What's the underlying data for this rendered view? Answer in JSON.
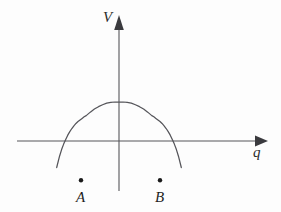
{
  "figure": {
    "kind": "line",
    "background_color": "#fdfdfd",
    "curve_color": "#55555a",
    "axis_color": "#56565a",
    "label_color": "#1f1f1f"
  },
  "axes": {
    "vertical": {
      "label": "V",
      "arrow": "arrow-up",
      "x_px": 119,
      "top_px": 16,
      "bottom_px": 191
    },
    "horizontal": {
      "label": "q",
      "arrow": "arrow-right",
      "y_px": 141,
      "left_px": 17,
      "right_px": 266
    },
    "origin_px": [
      119,
      141
    ]
  },
  "markers": [
    {
      "label": "A",
      "x_px": 81,
      "y_px": 180,
      "role": "left-minimum"
    },
    {
      "label": "B",
      "x_px": 160,
      "y_px": 180,
      "role": "right-minimum"
    }
  ],
  "chart_data": {
    "type": "line",
    "title": "",
    "xlabel": "q",
    "ylabel": "V",
    "grid": false,
    "legend": null,
    "annotations": [
      {
        "text": "A",
        "x": -1.0,
        "y": -0.55
      },
      {
        "text": "B",
        "x": 1.0,
        "y": -0.55
      }
    ],
    "axis_arrows": {
      "x": "right",
      "y": "up"
    },
    "xlim": [
      -1.85,
      3.3
    ],
    "ylim": [
      -0.9,
      2.4
    ],
    "series": [
      {
        "name": "V(q)",
        "equation": "V(q) = (q^2 - 1)^2 - 1",
        "x": [
          -1.52,
          -1.45,
          -1.4,
          -1.35,
          -1.3,
          -1.25,
          -1.2,
          -1.15,
          -1.1,
          -1.05,
          -1.0,
          -0.95,
          -0.9,
          -0.85,
          -0.8,
          -0.7,
          -0.6,
          -0.5,
          -0.4,
          -0.3,
          -0.2,
          -0.1,
          0.0,
          0.1,
          0.2,
          0.3,
          0.4,
          0.5,
          0.6,
          0.7,
          0.8,
          0.85,
          0.9,
          0.95,
          1.0,
          1.05,
          1.1,
          1.15,
          1.2,
          1.25,
          1.3,
          1.35,
          1.4,
          1.45,
          1.52
        ],
        "y": [
          0.68,
          0.39,
          0.22,
          0.08,
          -0.04,
          -0.15,
          -0.24,
          -0.32,
          -0.39,
          -0.45,
          -0.5,
          -0.54,
          -0.58,
          -0.62,
          -0.65,
          -0.74,
          -0.82,
          -0.88,
          -0.93,
          -0.97,
          -0.99,
          -1.0,
          -1.0,
          -1.0,
          -0.99,
          -0.97,
          -0.93,
          -0.88,
          -0.82,
          -0.74,
          -0.65,
          -0.62,
          -0.58,
          -0.54,
          -0.5,
          -0.45,
          -0.39,
          -0.32,
          -0.24,
          -0.15,
          -0.04,
          0.08,
          0.22,
          0.39,
          0.68
        ],
        "minima": [
          {
            "x": -1.0,
            "y": -1.0,
            "label": "A"
          },
          {
            "x": 1.0,
            "y": -1.0,
            "label": "B"
          }
        ],
        "local_maximum": {
          "x": 0.0,
          "y": 0.0
        },
        "zero_crossings": [
          -1.41,
          0.0,
          1.41
        ]
      }
    ]
  }
}
